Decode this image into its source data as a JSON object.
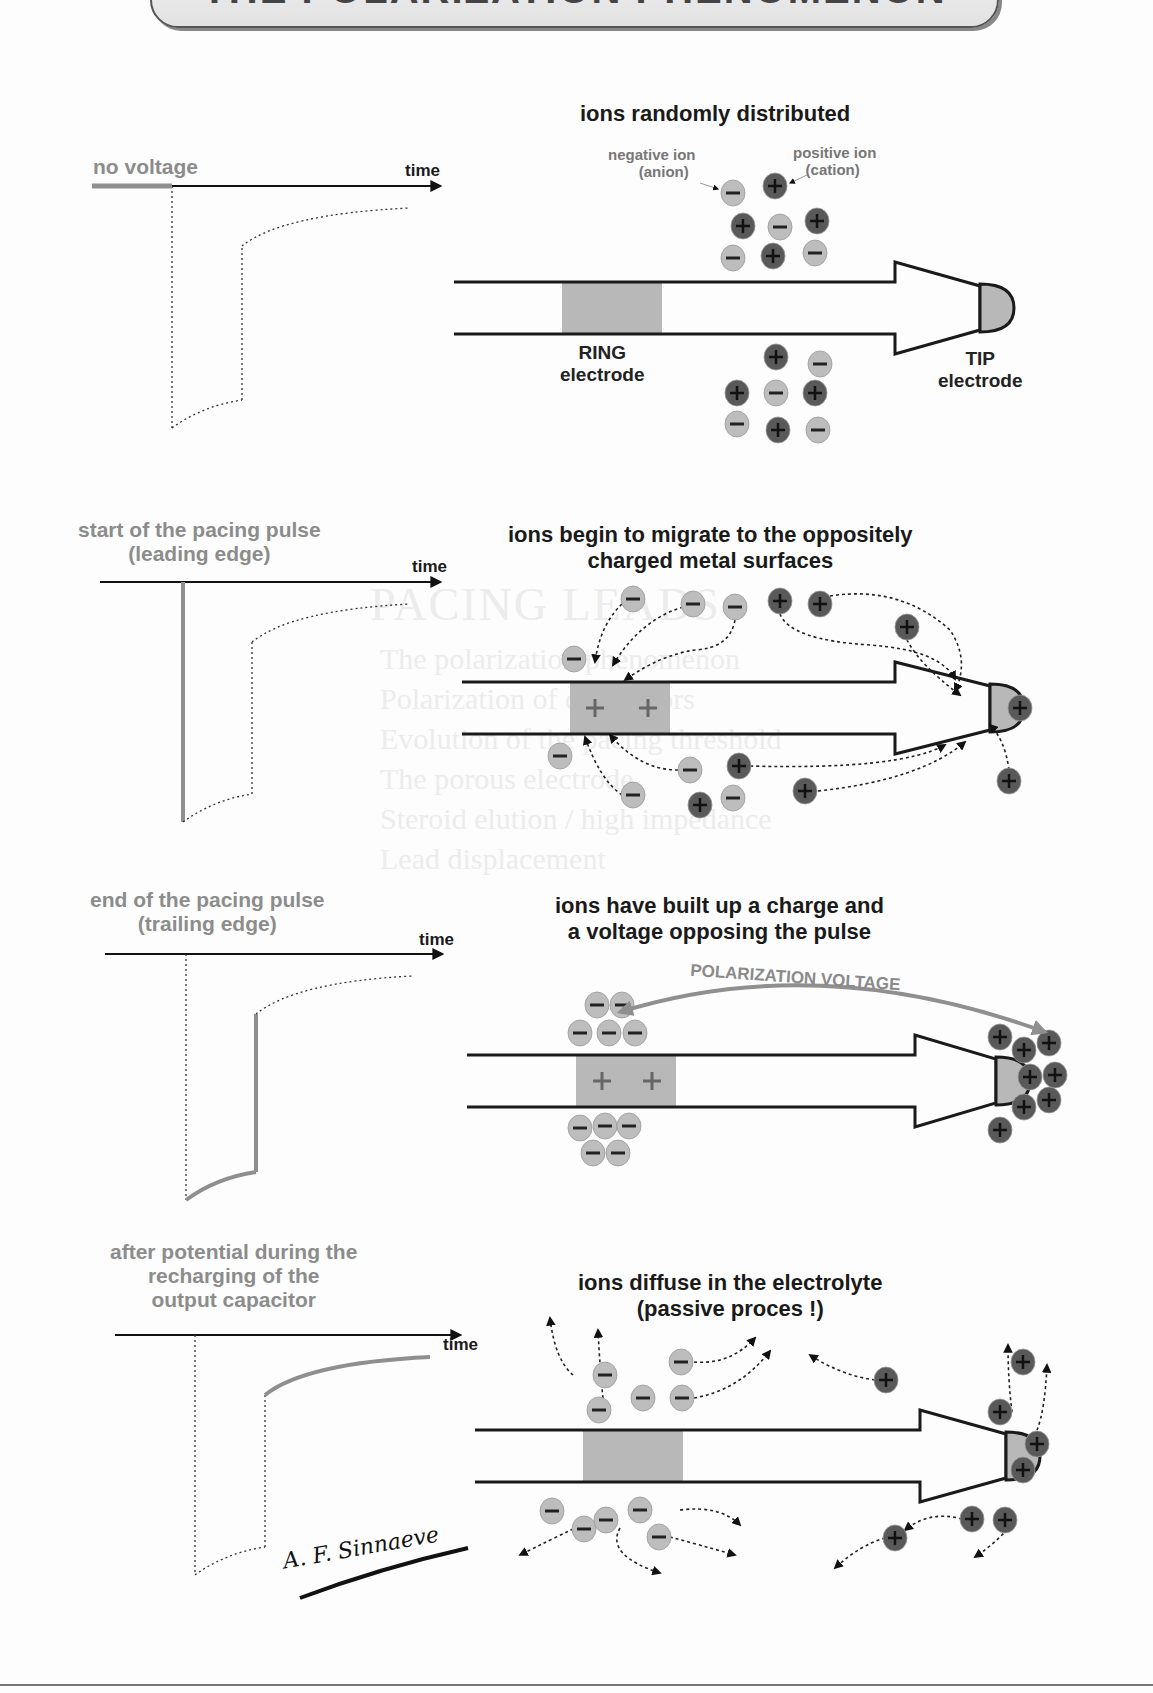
{
  "title": "THE POLARIZATION PHENOMENON",
  "ghost_text": {
    "heading": "PACING LEADS",
    "lines": [
      "The polarization phenomenon",
      "Polarization of connectors",
      "Evolution of the pacing threshold",
      "The porous electrode",
      "Steroid elution / high impedance",
      "Lead displacement"
    ]
  },
  "colors": {
    "anion_fill": "#bdbdbd",
    "cation_fill": "#595959",
    "electrode_fill": "#b8b8b8",
    "state_label": "#8c8c8c",
    "pulse_highlight": "#8f8f8f",
    "outline": "#1a1a1a"
  },
  "legend": {
    "negative_ion": "negative ion",
    "anion": "(anion)",
    "positive_ion": "positive ion",
    "cation": "(cation)"
  },
  "electrodes": {
    "ring": [
      "RING",
      "electrode"
    ],
    "tip": [
      "TIP",
      "electrode"
    ]
  },
  "panels": [
    {
      "state_label": [
        "no voltage"
      ],
      "time_label": "time",
      "heading": [
        "ions randomly distributed"
      ],
      "highlight": "baseline"
    },
    {
      "state_label": [
        "start of the pacing pulse",
        "(leading edge)"
      ],
      "time_label": "time",
      "heading": [
        "ions begin to migrate to the oppositely",
        "charged metal surfaces"
      ],
      "highlight": "leading_edge"
    },
    {
      "state_label": [
        "end of the pacing pulse",
        "(trailing edge)"
      ],
      "time_label": "time",
      "heading": [
        "ions have built up a charge and",
        "a voltage opposing the pulse"
      ],
      "annotation": "POLARIZATION VOLTAGE",
      "highlight": "trailing_edge"
    },
    {
      "state_label": [
        "after potential during the",
        "recharging of the",
        "output capacitor"
      ],
      "time_label": "time",
      "heading": [
        "ions diffuse in the electrolyte",
        "(passive proces !)"
      ],
      "highlight": "after_potential"
    }
  ],
  "signature": "A. F. Sinnaeve"
}
